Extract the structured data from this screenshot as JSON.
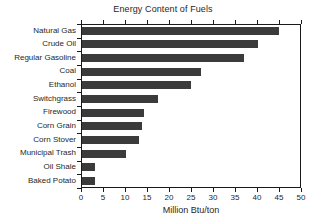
{
  "chart_data": {
    "type": "bar",
    "orientation": "horizontal",
    "title": "Energy Content of Fuels",
    "xlabel": "Million Btu/ton",
    "ylabel": "",
    "xlim": [
      0,
      50
    ],
    "xticks": [
      0,
      5,
      10,
      15,
      20,
      25,
      30,
      35,
      40,
      45,
      50
    ],
    "grid": false,
    "legend": null,
    "bar_color": "#3b3b3b",
    "categories": [
      "Natural Gas",
      "Crude Oil",
      "Regular Gasoline",
      "Coal",
      "Ethanol",
      "Switchgrass",
      "Firewood",
      "Corn Grain",
      "Corn Stover",
      "Municipal Trash",
      "Oil Shale",
      "Baked Potato"
    ],
    "values": [
      44.8,
      40.0,
      36.8,
      27.0,
      24.8,
      17.3,
      14.2,
      13.6,
      13.0,
      10.0,
      3.0,
      3.0
    ]
  }
}
